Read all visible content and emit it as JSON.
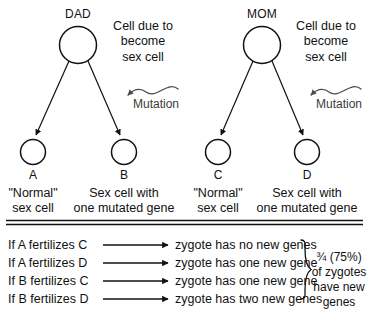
{
  "diagram": {
    "title_alt": "Inheritance of new mutations from parental sex cells",
    "parents": [
      {
        "id": "dad",
        "label": "DAD",
        "note_lines": [
          "Cell due to",
          "become",
          "sex cell"
        ],
        "mutation_label": "Mutation",
        "gametes": [
          {
            "id": "A",
            "letter": "A",
            "desc_lines": [
              "\"Normal\"",
              "sex cell"
            ]
          },
          {
            "id": "B",
            "letter": "B",
            "desc_lines": [
              "Sex cell with",
              "one mutated gene"
            ]
          }
        ]
      },
      {
        "id": "mom",
        "label": "MOM",
        "note_lines": [
          "Cell due to",
          "become",
          "sex cell"
        ],
        "mutation_label": "Mutation",
        "gametes": [
          {
            "id": "C",
            "letter": "C",
            "desc_lines": [
              "\"Normal\"",
              "sex cell"
            ]
          },
          {
            "id": "D",
            "letter": "D",
            "desc_lines": [
              "Sex cell with",
              "one mutated gene"
            ]
          }
        ]
      }
    ],
    "outcomes": [
      {
        "condition": "If A fertilizes C",
        "result": "zygote has no new genes"
      },
      {
        "condition": "If A fertilizes D",
        "result": "zygote has one new gene"
      },
      {
        "condition": "If B fertilizes C",
        "result": "zygote has one new gene"
      },
      {
        "condition": "If B fertilizes D",
        "result": "zygote has two new genes"
      }
    ],
    "summary_lines": [
      "¾ (75%)",
      "of zygotes",
      "have new",
      "genes"
    ],
    "colors": {
      "ink": "#111111",
      "muted_ink": "#3a3a3a",
      "background": "#ffffff"
    }
  }
}
